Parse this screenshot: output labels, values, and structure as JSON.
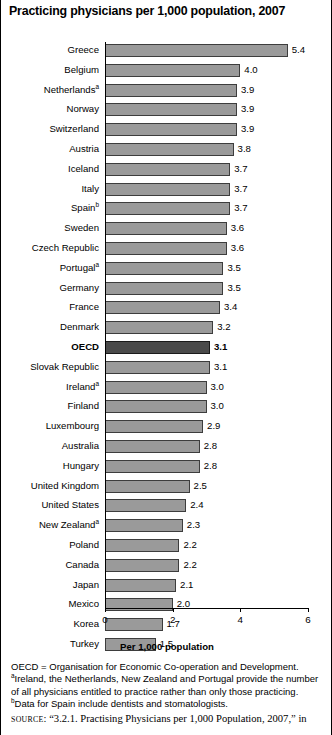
{
  "title": "Practicing physicians per 1,000 population, 2007",
  "axis_title": "Per 1,000 population",
  "notes": {
    "oecd_def": "OECD = Organisation for Economic Co-operation and Development.",
    "note_a_1": "Ireland, the Netherlands, New Zealand and Portugal provide the number",
    "note_a_2": "of all physicians entitled to practice rather than only those practicing.",
    "note_b": "Data for Spain include dentists and stomatologists.",
    "marker_a": "a",
    "marker_b": "b"
  },
  "source": {
    "word": "SOURCE",
    "text": ": “3.2.1. Practising Physicians per 1,000 Population, 2007,” in"
  },
  "colors": {
    "bar": "#9a9a9a",
    "bar_highlight": "#4a4a4a",
    "bar_border": "#3d3d3d",
    "axis": "#000000",
    "background": "#ffffff"
  },
  "chart_data": {
    "type": "bar",
    "orientation": "horizontal",
    "title": "Practicing physicians per 1,000 population, 2007",
    "xlabel": "Per 1,000 population",
    "ylabel": "",
    "xlim": [
      0,
      6
    ],
    "xticks": [
      0,
      2,
      4,
      6
    ],
    "xticklabels": [
      "0",
      "2",
      "4",
      "6"
    ],
    "grid": false,
    "legend": false,
    "highlight_category": "OECD",
    "categories": [
      "Greece",
      "Belgium",
      "Netherlands",
      "Norway",
      "Switzerland",
      "Austria",
      "Iceland",
      "Italy",
      "Spain",
      "Sweden",
      "Czech Republic",
      "Portugal",
      "Germany",
      "France",
      "Denmark",
      "OECD",
      "Slovak Republic",
      "Ireland",
      "Finland",
      "Luxembourg",
      "Australia",
      "Hungary",
      "United Kingdom",
      "United States",
      "New Zealand",
      "Poland",
      "Canada",
      "Japan",
      "Mexico",
      "Korea",
      "Turkey"
    ],
    "values": [
      5.4,
      4.0,
      3.9,
      3.9,
      3.9,
      3.8,
      3.7,
      3.7,
      3.7,
      3.6,
      3.6,
      3.5,
      3.5,
      3.4,
      3.2,
      3.1,
      3.1,
      3.0,
      3.0,
      2.9,
      2.8,
      2.8,
      2.5,
      2.4,
      2.3,
      2.2,
      2.2,
      2.1,
      2.0,
      1.7,
      1.5
    ],
    "value_labels": [
      "5.4",
      "4.0",
      "3.9",
      "3.9",
      "3.9",
      "3.8",
      "3.7",
      "3.7",
      "3.7",
      "3.6",
      "3.6",
      "3.5",
      "3.5",
      "3.4",
      "3.2",
      "3.1",
      "3.1",
      "3.0",
      "3.0",
      "2.9",
      "2.8",
      "2.8",
      "2.5",
      "2.4",
      "2.3",
      "2.2",
      "2.2",
      "2.1",
      "2.0",
      "1.7",
      "1.5"
    ],
    "footnote_markers": [
      "",
      "",
      "a",
      "",
      "",
      "",
      "",
      "",
      "b",
      "",
      "",
      "a",
      "",
      "",
      "",
      "",
      "",
      "a",
      "",
      "",
      "",
      "",
      "",
      "",
      "a",
      "",
      "",
      "",
      "",
      "",
      ""
    ],
    "rows": [
      {
        "label": "Greece",
        "value": 5.4,
        "value_label": "5.4",
        "marker": "",
        "highlight": false
      },
      {
        "label": "Belgium",
        "value": 4.0,
        "value_label": "4.0",
        "marker": "",
        "highlight": false
      },
      {
        "label": "Netherlands",
        "value": 3.9,
        "value_label": "3.9",
        "marker": "a",
        "highlight": false
      },
      {
        "label": "Norway",
        "value": 3.9,
        "value_label": "3.9",
        "marker": "",
        "highlight": false
      },
      {
        "label": "Switzerland",
        "value": 3.9,
        "value_label": "3.9",
        "marker": "",
        "highlight": false
      },
      {
        "label": "Austria",
        "value": 3.8,
        "value_label": "3.8",
        "marker": "",
        "highlight": false
      },
      {
        "label": "Iceland",
        "value": 3.7,
        "value_label": "3.7",
        "marker": "",
        "highlight": false
      },
      {
        "label": "Italy",
        "value": 3.7,
        "value_label": "3.7",
        "marker": "",
        "highlight": false
      },
      {
        "label": "Spain",
        "value": 3.7,
        "value_label": "3.7",
        "marker": "b",
        "highlight": false
      },
      {
        "label": "Sweden",
        "value": 3.6,
        "value_label": "3.6",
        "marker": "",
        "highlight": false
      },
      {
        "label": "Czech Republic",
        "value": 3.6,
        "value_label": "3.6",
        "marker": "",
        "highlight": false
      },
      {
        "label": "Portugal",
        "value": 3.5,
        "value_label": "3.5",
        "marker": "a",
        "highlight": false
      },
      {
        "label": "Germany",
        "value": 3.5,
        "value_label": "3.5",
        "marker": "",
        "highlight": false
      },
      {
        "label": "France",
        "value": 3.4,
        "value_label": "3.4",
        "marker": "",
        "highlight": false
      },
      {
        "label": "Denmark",
        "value": 3.2,
        "value_label": "3.2",
        "marker": "",
        "highlight": false
      },
      {
        "label": "OECD",
        "value": 3.1,
        "value_label": "3.1",
        "marker": "",
        "highlight": true
      },
      {
        "label": "Slovak Republic",
        "value": 3.1,
        "value_label": "3.1",
        "marker": "",
        "highlight": false
      },
      {
        "label": "Ireland",
        "value": 3.0,
        "value_label": "3.0",
        "marker": "a",
        "highlight": false
      },
      {
        "label": "Finland",
        "value": 3.0,
        "value_label": "3.0",
        "marker": "",
        "highlight": false
      },
      {
        "label": "Luxembourg",
        "value": 2.9,
        "value_label": "2.9",
        "marker": "",
        "highlight": false
      },
      {
        "label": "Australia",
        "value": 2.8,
        "value_label": "2.8",
        "marker": "",
        "highlight": false
      },
      {
        "label": "Hungary",
        "value": 2.8,
        "value_label": "2.8",
        "marker": "",
        "highlight": false
      },
      {
        "label": "United Kingdom",
        "value": 2.5,
        "value_label": "2.5",
        "marker": "",
        "highlight": false
      },
      {
        "label": "United States",
        "value": 2.4,
        "value_label": "2.4",
        "marker": "",
        "highlight": false
      },
      {
        "label": "New Zealand",
        "value": 2.3,
        "value_label": "2.3",
        "marker": "a",
        "highlight": false
      },
      {
        "label": "Poland",
        "value": 2.2,
        "value_label": "2.2",
        "marker": "",
        "highlight": false
      },
      {
        "label": "Canada",
        "value": 2.2,
        "value_label": "2.2",
        "marker": "",
        "highlight": false
      },
      {
        "label": "Japan",
        "value": 2.1,
        "value_label": "2.1",
        "marker": "",
        "highlight": false
      },
      {
        "label": "Mexico",
        "value": 2.0,
        "value_label": "2.0",
        "marker": "",
        "highlight": false
      },
      {
        "label": "Korea",
        "value": 1.7,
        "value_label": "1.7",
        "marker": "",
        "highlight": false
      },
      {
        "label": "Turkey",
        "value": 1.5,
        "value_label": "1.5",
        "marker": "",
        "highlight": false
      }
    ]
  }
}
